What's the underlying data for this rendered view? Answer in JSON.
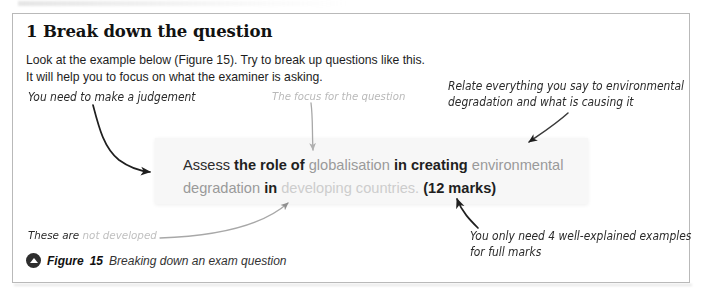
{
  "card": {
    "heading": "1 Break down the question",
    "intro_line1": "Look at the example below (Figure 15). Try to break up questions like this.",
    "intro_line2": "It will help you to focus on what the examiner is asking."
  },
  "annotations": {
    "judgement": "You need to make a judgement",
    "focus": "The focus for the question",
    "relate_line1": "Relate everything you say to environmental",
    "relate_line2": "degradation and what is causing it",
    "these_are_dark": "These are",
    "these_are_faded": "not developed",
    "examples_line1": "You only need 4 well-explained examples",
    "examples_line2": "for full marks"
  },
  "question_box": {
    "seg1_dark": "Assess",
    "seg2_bold": "the role of",
    "seg3_mid": "globalisation",
    "seg4_bold": "in creating",
    "seg5_mid": "environmental degradation",
    "seg6_bold": "in",
    "seg7_light": "developing countries.",
    "seg8_marks": "(12 marks)"
  },
  "caption": {
    "icon": "triangle-up-circle-icon",
    "label": "Figure",
    "number": "15",
    "text": "Breaking down an exam question"
  },
  "colors": {
    "card_border": "#b9b9b9",
    "question_panel": "#f7f7f7",
    "ink_dark": "#2b2b2b",
    "ink_mid": "#9a9a9a",
    "ink_light": "#cdcdcd",
    "arrow_dark": "#1f1f1f",
    "arrow_light": "#b0b0b0"
  }
}
